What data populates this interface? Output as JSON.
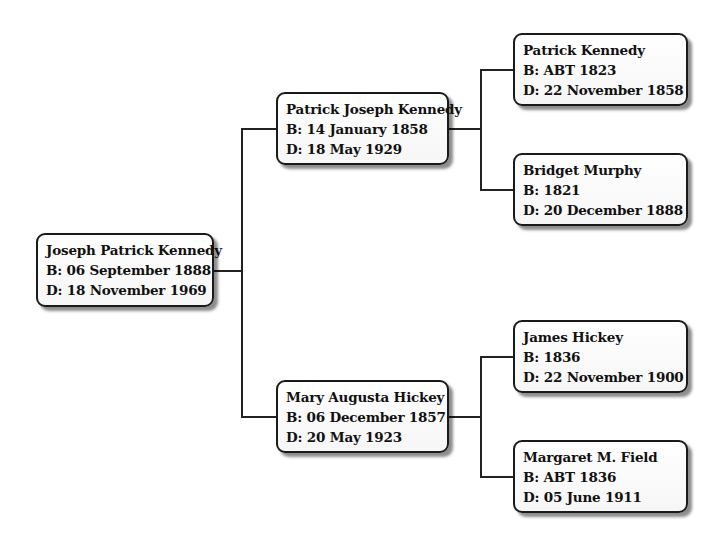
{
  "tree": {
    "root": {
      "name": "Joseph Patrick Kennedy",
      "birth": "B: 06 September 1888",
      "death": "D: 18 November 1969"
    },
    "father": {
      "name": "Patrick Joseph Kennedy",
      "birth": "B: 14 January 1858",
      "death": "D: 18 May 1929"
    },
    "mother": {
      "name": "Mary Augusta Hickey",
      "birth": "B: 06 December 1857",
      "death": "D: 20 May 1923"
    },
    "paternal_grandfather": {
      "name": "Patrick Kennedy",
      "birth": "B: ABT 1823",
      "death": "D: 22 November 1858"
    },
    "paternal_grandmother": {
      "name": "Bridget Murphy",
      "birth": "B: 1821",
      "death": "D: 20 December 1888"
    },
    "maternal_grandfather": {
      "name": "James Hickey",
      "birth": "B: 1836",
      "death": "D: 22 November 1900"
    },
    "maternal_grandmother": {
      "name": "Margaret M. Field",
      "birth": "B: ABT 1836",
      "death": "D: 05 June 1911"
    }
  }
}
